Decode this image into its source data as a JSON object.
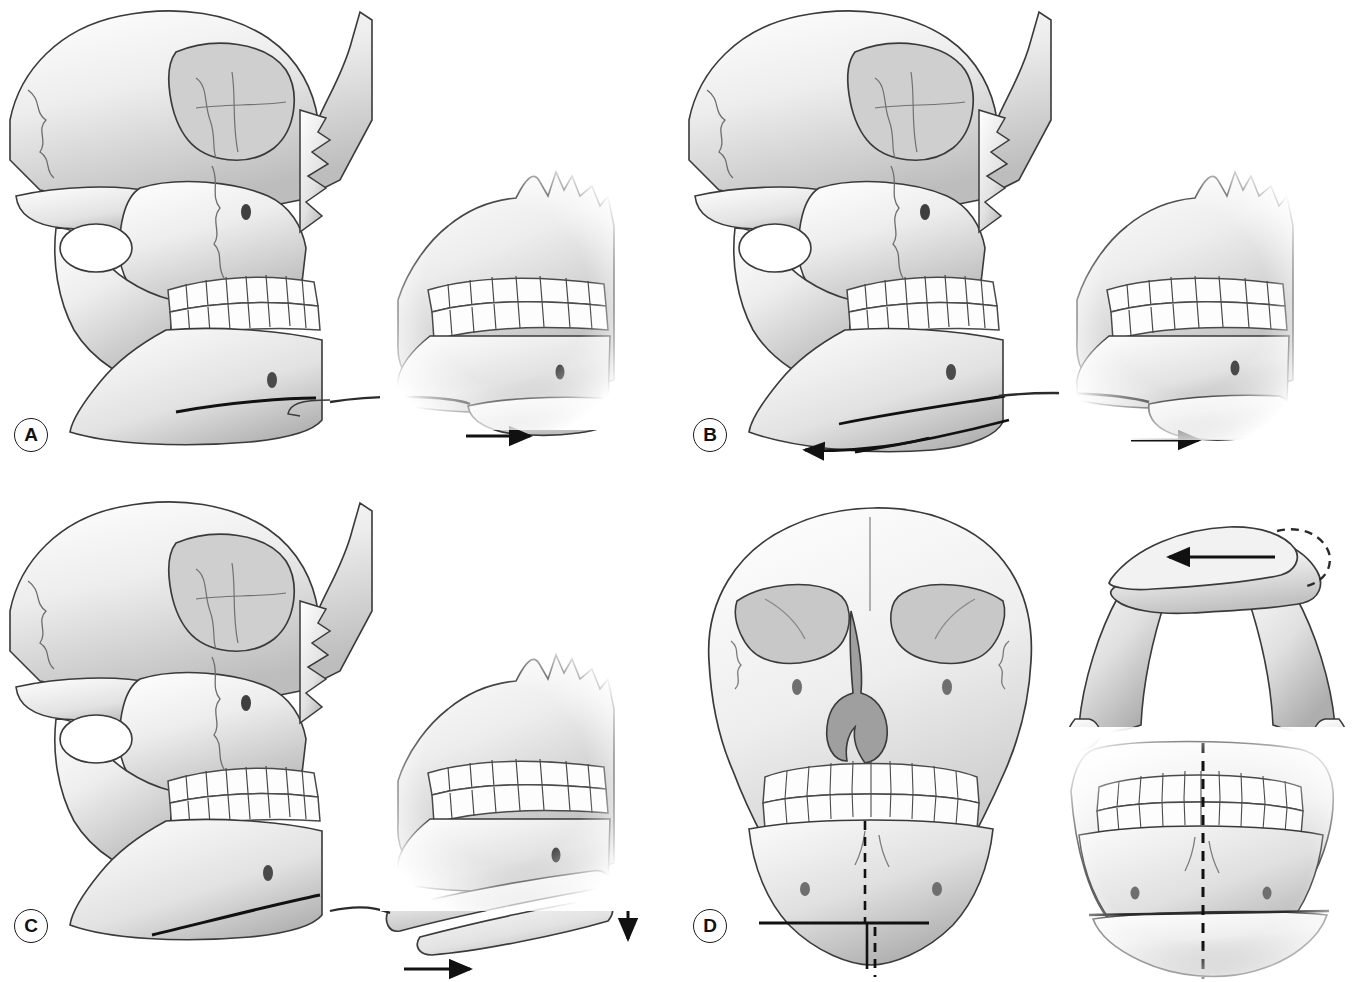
{
  "figure": {
    "title": "Genioplasty osteotomy variations",
    "background_color": "#ffffff",
    "ink_color": "#2b2b2b",
    "bone_light": "#fbfbfb",
    "bone_mid": "#d8d8d8",
    "bone_shadow": "#9a9a9a",
    "layout": "2 x 2 panel grid",
    "panel_count": 4
  },
  "panels": [
    {
      "id": "A",
      "label": "A",
      "position": "top-left",
      "procedure": "Advancement genioplasty",
      "views": [
        {
          "name": "lateral-skull",
          "description": "Lateral view of skull with horizontal osteotomy line across the chin",
          "cut_line": "single straight horizontal osteotomy",
          "arrows": []
        },
        {
          "name": "chin-inset",
          "description": "Close-up of mandibular symphysis with chin segment moved forward",
          "cut_line": "single straight horizontal osteotomy",
          "arrows": [
            {
              "name": "advancement-arrow",
              "direction": "right",
              "meaning": "anterior advancement"
            }
          ]
        }
      ]
    },
    {
      "id": "B",
      "label": "B",
      "position": "top-right",
      "procedure": "Setback (reduction) genioplasty",
      "views": [
        {
          "name": "lateral-skull",
          "description": "Lateral skull with double osteotomy lines and posteriorly directed arrow",
          "cut_line": "two parallel osteotomy lines (wedge removal)",
          "arrows": [
            {
              "name": "setback-arrow",
              "direction": "left",
              "meaning": "posterior setback"
            }
          ]
        },
        {
          "name": "chin-inset",
          "description": "Close-up of repositioned chin segment",
          "cut_line": "single curved osteotomy",
          "arrows": [
            {
              "name": "advancement-arrow",
              "direction": "right",
              "meaning": "segment repositioning"
            }
          ]
        }
      ]
    },
    {
      "id": "C",
      "label": "C",
      "position": "bottom-left",
      "procedure": "Lengthening (vertical augmentation) genioplasty",
      "views": [
        {
          "name": "lateral-skull",
          "description": "Lateral skull with oblique osteotomy line across the chin",
          "cut_line": "single oblique osteotomy",
          "arrows": []
        },
        {
          "name": "chin-inset",
          "description": "Close-up with chin segment advanced and dropped inferiorly leaving an interpositional gap",
          "cut_line": "two osteotomy lines with interpositional gap",
          "arrows": [
            {
              "name": "advancement-arrow",
              "direction": "right",
              "meaning": "anterior advancement"
            },
            {
              "name": "lengthening-arrow",
              "direction": "down",
              "meaning": "vertical lengthening"
            }
          ]
        }
      ]
    },
    {
      "id": "D",
      "label": "D",
      "position": "bottom-right",
      "procedure": "Asymmetry correction / transverse repositioning genioplasty",
      "views": [
        {
          "name": "frontal-skull",
          "description": "Frontal view of skull with horizontal osteotomy line and dashed midline references showing chin deviation",
          "cut_line": "horizontal osteotomy with step",
          "reference_lines": [
            "dashed upper facial midline",
            "dashed chin midline"
          ],
          "arrows": []
        },
        {
          "name": "mandible-axial-inset",
          "description": "Inferior (axial) view of the mandible, chin segment slid laterally with dashed outline of original position",
          "arrows": [
            {
              "name": "lateral-shift-arrow",
              "direction": "left",
              "meaning": "transverse lateral shift"
            }
          ]
        },
        {
          "name": "mandible-frontal-inset",
          "description": "Frontal close-up of the mandible with chin segment shifted relative to dashed midline",
          "reference_lines": [
            "dashed midline"
          ],
          "arrows": []
        }
      ]
    }
  ]
}
